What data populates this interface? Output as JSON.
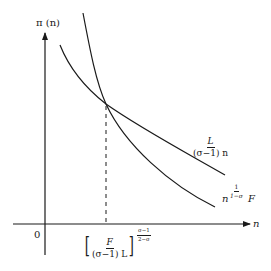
{
  "diagram": {
    "y_axis_label": "π (n)",
    "x_axis_label": "n",
    "origin_label": "0",
    "curve_flat": {
      "label_numerator": "L",
      "label_denominator": "(σ−1) n"
    },
    "curve_steep": {
      "label_base": "n",
      "label_exp_numerator": "1",
      "label_exp_denominator": "1−σ",
      "label_suffix": "F"
    },
    "equilibrium_tick": {
      "bracket_left": "[",
      "bracket_right": "]",
      "numerator": "F",
      "denominator": "(σ−1) L",
      "exp_numerator": "σ−1",
      "exp_denominator": "2−σ"
    },
    "colors": {
      "line": "#1a1a1a",
      "background": "#ffffff"
    }
  }
}
